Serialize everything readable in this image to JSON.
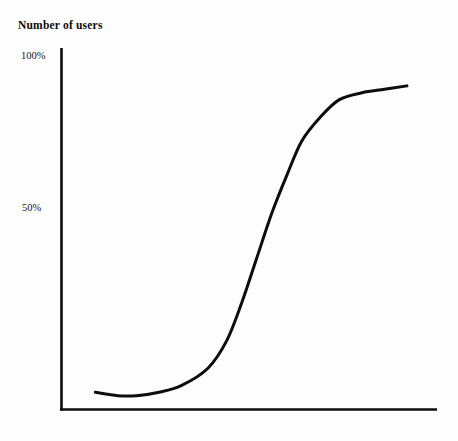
{
  "figure": {
    "background_color": "#fdfdfd",
    "ink_color": "#0d0d0d"
  },
  "chart_data": {
    "type": "line",
    "title": "",
    "xlabel": "Time",
    "ylabel": "Number of users",
    "y_tick_labels": [
      "100%",
      "50%"
    ],
    "y_tick_values": [
      100,
      50
    ],
    "x_tick_labels": [],
    "grid": false,
    "legend": null,
    "axes": {
      "style": "L-shaped spines (left and bottom only)",
      "xlim": [
        0,
        100
      ],
      "ylim": [
        0,
        105
      ]
    },
    "series": [
      {
        "name": "Adoption curve",
        "shape": "sigmoid / S-curve",
        "color": "#0d0d0d",
        "line_width": 3,
        "x": [
          9,
          15,
          20,
          26,
          32,
          39,
          44,
          48,
          52,
          56,
          60,
          64,
          69,
          74,
          80,
          86,
          92
        ],
        "y": [
          5,
          4,
          4,
          5,
          7,
          12,
          20,
          31,
          44,
          57,
          68,
          78,
          85,
          90,
          92,
          93,
          94
        ]
      }
    ],
    "annotations": []
  },
  "labels": {
    "y_axis_title": "Number of users",
    "x_axis_title": "Time",
    "tick_100": "100%",
    "tick_50": "50%"
  }
}
